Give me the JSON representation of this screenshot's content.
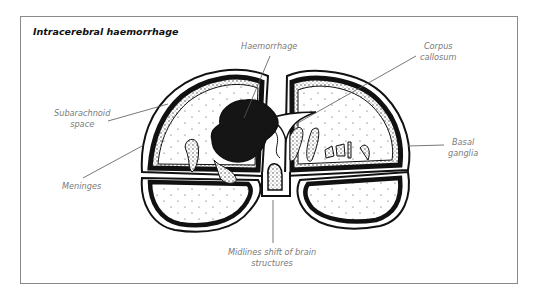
{
  "figure": {
    "title": "Intracerebral haemorrhage",
    "labels": {
      "haemorrhage": "Haemorrhage",
      "corpus_callosum_1": "Corpus",
      "corpus_callosum_2": "callosum",
      "subarachnoid_1": "Subarachnoid",
      "subarachnoid_2": "space",
      "meninges": "Meninges",
      "basal_ganglia_1": "Basal",
      "basal_ganglia_2": "ganglia",
      "midline_1": "Midlines shift of brain",
      "midline_2": "structures"
    },
    "colors": {
      "frame": "#8a8a8a",
      "ink": "#111111",
      "label": "#7a7a7a",
      "haemorrhage": "#151515"
    }
  }
}
